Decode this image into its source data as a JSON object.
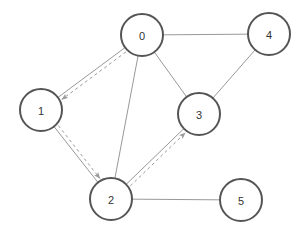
{
  "diagram": {
    "width": 305,
    "height": 235,
    "background_color": "#ffffff"
  },
  "style": {
    "node_fill": "#ffffff",
    "node_stroke": "#555555",
    "node_stroke_width": 2,
    "node_radius": 21,
    "node_label_color": "#333333",
    "node_label_size": 11,
    "edge_color": "#999999",
    "edge_width": 1,
    "arrow_color": "#9a9a9a",
    "arrow_width": 1,
    "arrow_dash": "3 3"
  },
  "nodes": [
    {
      "id": "0",
      "label": "0",
      "cx": 142,
      "cy": 35
    },
    {
      "id": "1",
      "label": "1",
      "cx": 41,
      "cy": 110
    },
    {
      "id": "2",
      "label": "2",
      "cx": 111,
      "cy": 199
    },
    {
      "id": "3",
      "label": "3",
      "cx": 199,
      "cy": 114
    },
    {
      "id": "4",
      "label": "4",
      "cx": 269,
      "cy": 34
    },
    {
      "id": "5",
      "label": "5",
      "cx": 241,
      "cy": 200
    }
  ],
  "edges": [
    {
      "source": "0",
      "target": "1",
      "style": "solid",
      "directed": false
    },
    {
      "source": "0",
      "target": "2",
      "style": "solid",
      "directed": false
    },
    {
      "source": "0",
      "target": "3",
      "style": "solid",
      "directed": false
    },
    {
      "source": "0",
      "target": "4",
      "style": "solid",
      "directed": false
    },
    {
      "source": "1",
      "target": "2",
      "style": "solid",
      "directed": false
    },
    {
      "source": "2",
      "target": "3",
      "style": "solid",
      "directed": false
    },
    {
      "source": "2",
      "target": "5",
      "style": "solid",
      "directed": false
    },
    {
      "source": "3",
      "target": "4",
      "style": "solid",
      "directed": false
    }
  ],
  "path_arrows": [
    {
      "source": "0",
      "target": "1",
      "style": "dashed",
      "directed": true,
      "offset": -4
    },
    {
      "source": "1",
      "target": "2",
      "style": "dashed",
      "directed": true,
      "offset": -4
    },
    {
      "source": "2",
      "target": "3",
      "style": "dashed",
      "directed": true,
      "offset": 4
    }
  ],
  "path_sequence": [
    "0",
    "1",
    "2",
    "3"
  ]
}
